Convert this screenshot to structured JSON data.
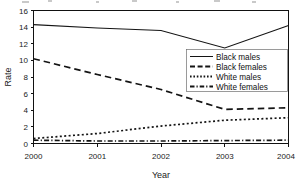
{
  "chart_data": {
    "type": "line",
    "title": "",
    "xlabel": "Year",
    "ylabel": "Rate",
    "x": [
      2000,
      2001,
      2002,
      2003,
      2004
    ],
    "xtick_labels": [
      "2000",
      "2001",
      "2002",
      "2003",
      "2004"
    ],
    "ytick_labels": [
      "0",
      "2",
      "4",
      "6",
      "8",
      "10",
      "12",
      "14",
      "16"
    ],
    "ytick_values": [
      0,
      2,
      4,
      6,
      8,
      10,
      12,
      14,
      16
    ],
    "ylim": [
      0,
      16
    ],
    "xlim": [
      2000,
      2004
    ],
    "grid": false,
    "legend_position": "center-right",
    "series": [
      {
        "name": "Black males",
        "style": "solid",
        "values": [
          14.3,
          13.9,
          13.6,
          11.5,
          14.2
        ]
      },
      {
        "name": "Black females",
        "style": "dashed",
        "values": [
          10.2,
          8.3,
          6.5,
          4.1,
          4.3
        ]
      },
      {
        "name": "White males",
        "style": "dotted",
        "values": [
          0.6,
          1.2,
          2.1,
          2.8,
          3.1
        ]
      },
      {
        "name": "White females",
        "style": "dashdot",
        "values": [
          0.4,
          0.3,
          0.3,
          0.35,
          0.4
        ]
      }
    ]
  },
  "legend": {
    "entries": [
      {
        "label": "Black males"
      },
      {
        "label": "Black females"
      },
      {
        "label": "White males"
      },
      {
        "label": "White females"
      }
    ]
  },
  "colors": {
    "ink": "#141414",
    "axis": "#111111",
    "background": "#ffffff"
  }
}
